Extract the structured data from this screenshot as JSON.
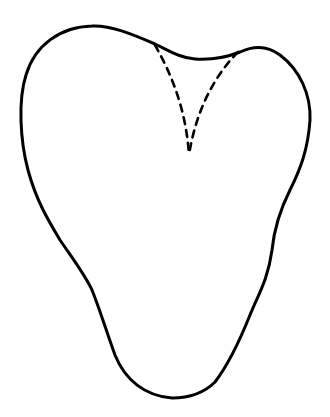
{
  "figure": {
    "subject": "tooth outline",
    "colors": {
      "background": "#ffffff",
      "stroke": "#000000"
    },
    "outline": {
      "style": "solid",
      "stroke_width": 3
    },
    "inner_lines": {
      "style": "dashed",
      "stroke_width": 2.6,
      "count": 2
    }
  }
}
